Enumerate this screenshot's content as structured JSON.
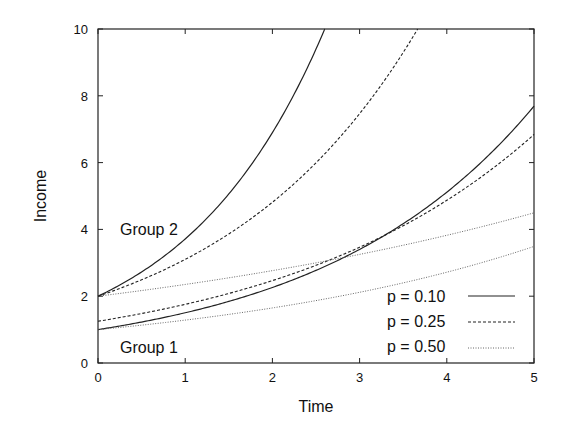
{
  "chart_data": {
    "type": "line",
    "title": "",
    "xlabel": "Time",
    "ylabel": "Income",
    "xlim": [
      0,
      5
    ],
    "ylim": [
      0,
      10
    ],
    "xticks": [
      "0",
      "1",
      "2",
      "3",
      "4",
      "5"
    ],
    "yticks": [
      "0",
      "2",
      "4",
      "6",
      "8",
      "10"
    ],
    "grid": false,
    "legend_position": "lower right",
    "legend": [
      {
        "label": "p = 0.10",
        "style": "solid"
      },
      {
        "label": "p = 0.25",
        "style": "dashed"
      },
      {
        "label": "p = 0.50",
        "style": "dotted"
      }
    ],
    "annotations": [
      {
        "text": "Group 2",
        "x": 0.25,
        "y": 4.0
      },
      {
        "text": "Group 1",
        "x": 0.25,
        "y": 0.5
      }
    ],
    "x": [
      0,
      0.5,
      1,
      1.5,
      2,
      2.5,
      3,
      3.5,
      4,
      4.5,
      5
    ],
    "series": [
      {
        "name": "Group 1, p = 0.10",
        "style": "solid",
        "start": 1.0,
        "rate": 0.408,
        "values": [
          1.0,
          1.23,
          1.5,
          1.84,
          2.26,
          2.77,
          3.4,
          4.17,
          5.11,
          6.27,
          7.7
        ]
      },
      {
        "name": "Group 1, p = 0.25",
        "style": "dashed",
        "start": 1.25,
        "rate": 0.34,
        "values": [
          1.25,
          1.48,
          1.76,
          2.08,
          2.47,
          2.92,
          3.47,
          4.11,
          4.86,
          5.76,
          6.83
        ]
      },
      {
        "name": "Group 1, p = 0.50",
        "style": "dotted",
        "start": 1.0,
        "rate": 0.25,
        "values": [
          1.0,
          1.13,
          1.28,
          1.45,
          1.65,
          1.87,
          2.12,
          2.4,
          2.72,
          3.08,
          3.5
        ]
      },
      {
        "name": "Group 2, p = 0.10",
        "style": "solid",
        "start": 2.0,
        "rate": 0.619,
        "values": [
          2.0,
          2.72,
          3.71,
          5.05,
          6.88,
          9.37,
          12.76,
          null,
          null,
          null,
          null
        ]
      },
      {
        "name": "Group 2, p = 0.25",
        "style": "dashed",
        "start": 2.0,
        "rate": 0.439,
        "values": [
          2.0,
          2.49,
          3.1,
          3.87,
          4.82,
          6.0,
          7.47,
          9.31,
          11.6,
          null,
          null
        ]
      },
      {
        "name": "Group 2, p = 0.50",
        "style": "dotted",
        "start": 2.0,
        "rate": 0.162,
        "values": [
          2.0,
          2.17,
          2.35,
          2.55,
          2.76,
          3.0,
          3.25,
          3.52,
          3.82,
          4.14,
          4.5
        ]
      }
    ]
  }
}
